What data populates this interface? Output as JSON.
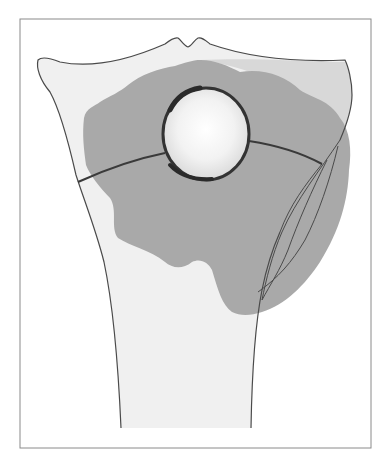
{
  "figure": {
    "type": "anatomical-diagram",
    "colors": {
      "background": "#ffffff",
      "frame": "#8a8a8a",
      "outline": "#4a4a4a",
      "bone_fill": "#efefef",
      "shaded_zone": "#a9a9a9",
      "light_zone": "#d6d6d6",
      "lesion_rim": "#3a3a3a",
      "lesion_center": "#ffffff",
      "lesion_edge": "#dcdcdc"
    },
    "lesion": {
      "cx": 206,
      "cy": 134,
      "r": 43
    },
    "labels": []
  }
}
